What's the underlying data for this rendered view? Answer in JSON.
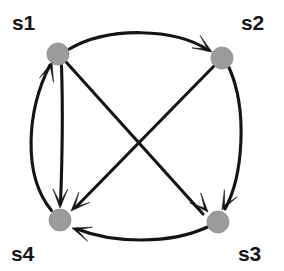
{
  "figure": {
    "background_color": "#ffffff",
    "width": 284,
    "height": 271
  },
  "style": {
    "node_fill": "#9b9b9b",
    "node_stroke": "#8d8d8d",
    "edge_color": "#141414",
    "label_color": "#171717",
    "node_radius": 11,
    "edge_width": 3.1
  },
  "nodes": [
    {
      "id": "s1",
      "label": "s1",
      "cx": 58,
      "cy": 54,
      "r": 11,
      "label_x": 12,
      "label_y": 30
    },
    {
      "id": "s2",
      "label": "s2",
      "cx": 222,
      "cy": 58,
      "r": 11,
      "label_x": 241,
      "label_y": 30
    },
    {
      "id": "s3",
      "label": "s3",
      "cx": 218,
      "cy": 222,
      "r": 11,
      "label_x": 238,
      "label_y": 261
    },
    {
      "id": "s4",
      "label": "s4",
      "cx": 60,
      "cy": 220,
      "r": 11,
      "label_x": 11,
      "label_y": 261
    }
  ],
  "edges": [
    {
      "id": "e-s1-s2",
      "from": "s1",
      "to": "s2",
      "shape": "curve-up",
      "label": ""
    },
    {
      "id": "e-s1-s3",
      "from": "s1",
      "to": "s3",
      "shape": "diagonal",
      "label": ""
    },
    {
      "id": "e-s1-s4",
      "from": "s1",
      "to": "s4",
      "shape": "near-straight",
      "label": ""
    },
    {
      "id": "e-s2-s3",
      "from": "s2",
      "to": "s3",
      "shape": "curve-right",
      "label": ""
    },
    {
      "id": "e-s2-s4",
      "from": "s2",
      "to": "s4",
      "shape": "diagonal",
      "label": ""
    },
    {
      "id": "e-s3-s4",
      "from": "s3",
      "to": "s4",
      "shape": "curve-down",
      "label": ""
    },
    {
      "id": "e-s4-s1",
      "from": "s4",
      "to": "s1",
      "shape": "curve-left",
      "label": ""
    }
  ],
  "geometry": {
    "paths": {
      "e-s1-s2": "M 68.5 49.5 C 108 26, 175 28, 208 50",
      "e-s1-s3": "M 66.5 62.5 L 203 214",
      "e-s1-s4": "M 61.5 65.5 C 63 110, 62 165, 60.5 204",
      "e-s2-s3": "M 229 67.5 C 248 110, 243 176, 225 209",
      "e-s2-s4": "M 213.5 66.5 L 76 207",
      "e-s3-s4": "M 208.5 226.5 C 170 245, 112 243, 77 229",
      "e-s4-s1": "M 51.5 210.5 C 22 175, 27 110, 50 65"
    },
    "arrowheads": {
      "e-s1-s2": {
        "tip_x": 212,
        "tip_y": 52,
        "angle": 33
      },
      "e-s1-s3": {
        "tip_x": 208,
        "tip_y": 212,
        "angle": 48
      },
      "e-s1-s4": {
        "tip_x": 60,
        "tip_y": 208,
        "angle": 91
      },
      "e-s2-s3": {
        "tip_x": 222,
        "tip_y": 210,
        "angle": 118
      },
      "e-s2-s4": {
        "tip_x": 71,
        "tip_y": 211,
        "angle": 134
      },
      "e-s3-s4": {
        "tip_x": 72,
        "tip_y": 228,
        "angle": 199
      },
      "e-s4-s1": {
        "tip_x": 52,
        "tip_y": 62,
        "angle": 287
      }
    }
  }
}
